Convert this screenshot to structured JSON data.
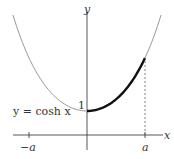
{
  "chart_data": {
    "type": "line",
    "title": "",
    "function": "y = cosh x",
    "xlabel": "x",
    "ylabel": "y",
    "x_ticks": [
      "-a",
      "a"
    ],
    "y_ticks": [
      "1"
    ],
    "series": [
      {
        "name": "y = cosh x",
        "domain": [
          -1.85,
          1.85
        ],
        "style": "thin gray"
      },
      {
        "name": "highlighted arc",
        "domain": [
          0,
          1.45
        ],
        "style": "thick black"
      }
    ],
    "annotations": [
      {
        "text": "y = cosh x",
        "position": "left of minimum"
      },
      {
        "text": "1",
        "position": "y-intercept"
      },
      {
        "text": "dashed vertical line at x = a",
        "position": "from x-axis up to curve"
      }
    ],
    "a_value_approx": 1.45,
    "grid": false,
    "legend": "none"
  },
  "labels": {
    "x_axis": "x",
    "y_axis": "y",
    "curve": "y = cosh x",
    "one": "1",
    "neg_a": "−a",
    "a": "a"
  }
}
